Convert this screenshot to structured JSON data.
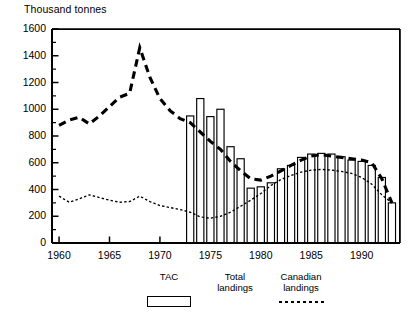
{
  "chart_data": {
    "type": "bar",
    "title": "",
    "ylabel": "Thousand tonnes",
    "xlabel": "",
    "ylim": [
      0,
      1600
    ],
    "xlim": [
      1959.3,
      1993.8
    ],
    "ytick_step": 200,
    "yminor_step": 100,
    "grid": false,
    "legend_position": "below-axis",
    "y_ticks": [
      0,
      200,
      400,
      600,
      800,
      1000,
      1200,
      1400,
      1600
    ],
    "y_tick_labels": [
      "0",
      "200",
      "400",
      "600",
      "800",
      "1000",
      "1200",
      "1400",
      "1600"
    ],
    "x_ticks": [
      1960,
      1965,
      1970,
      1975,
      1980,
      1985,
      1990
    ],
    "x_tick_labels": [
      "1960",
      "1965",
      "1970",
      "1975",
      "1980",
      "1985",
      "1990"
    ],
    "series": [
      {
        "name": "Total landings",
        "type": "bar",
        "style": "open-bar",
        "x": [
          1973,
          1974,
          1975,
          1976,
          1977,
          1978,
          1979,
          1980,
          1981,
          1982,
          1983,
          1984,
          1985,
          1986,
          1987,
          1988,
          1989,
          1990,
          1991,
          1992,
          1993
        ],
        "values": [
          950,
          1080,
          945,
          1000,
          720,
          630,
          410,
          420,
          450,
          555,
          580,
          640,
          665,
          670,
          665,
          645,
          620,
          610,
          580,
          490,
          300
        ]
      },
      {
        "name": "TAC",
        "type": "line",
        "style": "bold-dashed",
        "x": [
          1960,
          1961,
          1962,
          1963,
          1964,
          1965,
          1966,
          1967,
          1968,
          1969,
          1970,
          1971,
          1972,
          1973,
          1974,
          1975,
          1976,
          1977,
          1978,
          1979,
          1980,
          1981,
          1982,
          1983,
          1984,
          1985,
          1986,
          1987,
          1988,
          1989,
          1990,
          1991,
          1992,
          1993
        ],
        "values": [
          880,
          920,
          940,
          890,
          950,
          1020,
          1090,
          1120,
          1460,
          1240,
          1080,
          990,
          930,
          900,
          830,
          760,
          700,
          610,
          540,
          480,
          470,
          500,
          540,
          580,
          620,
          650,
          660,
          650,
          640,
          630,
          620,
          600,
          480,
          300
        ]
      },
      {
        "name": "Canadian landings",
        "type": "line",
        "style": "fine-dotted",
        "x": [
          1960,
          1961,
          1962,
          1963,
          1964,
          1965,
          1966,
          1967,
          1968,
          1969,
          1970,
          1971,
          1972,
          1973,
          1974,
          1975,
          1976,
          1977,
          1978,
          1979,
          1980,
          1981,
          1982,
          1983,
          1984,
          1985,
          1986,
          1987,
          1988,
          1989,
          1990,
          1991,
          1992,
          1993
        ],
        "values": [
          350,
          305,
          330,
          360,
          340,
          320,
          305,
          310,
          350,
          310,
          280,
          265,
          250,
          230,
          195,
          185,
          200,
          230,
          275,
          320,
          370,
          430,
          475,
          505,
          530,
          545,
          550,
          545,
          535,
          520,
          490,
          440,
          360,
          300
        ]
      }
    ]
  },
  "legend": {
    "items": [
      {
        "label_line1": "TAC",
        "label_line2": "",
        "swatch": "dashed-line"
      },
      {
        "label_line1": "Total",
        "label_line2": "landings",
        "swatch": "open-rectangle"
      },
      {
        "label_line1": "Canadian",
        "label_line2": "landings",
        "swatch": "dotted-line"
      }
    ]
  },
  "caption": {
    "text": ""
  }
}
